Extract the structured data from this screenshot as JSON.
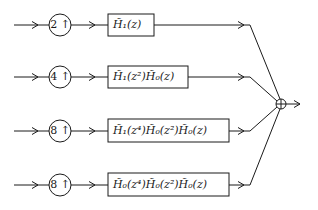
{
  "diagram": {
    "type": "synthesis filter bank (tree-equivalent)",
    "branches": [
      {
        "upsampler": "2 ↑",
        "filter": "H̃₁(z)"
      },
      {
        "upsampler": "4 ↑",
        "filter": "H̃₁(z²)H̃₀(z)"
      },
      {
        "upsampler": "8 ↑",
        "filter": "H̃₁(z⁴)H̃₀(z²)H̃₀(z)"
      },
      {
        "upsampler": "8 ↑",
        "filter": "H̃₀(z⁴)H̃₀(z²)H̃₀(z)"
      }
    ],
    "summer": "⊕",
    "colors": {
      "stroke": "#1a1a1a",
      "background": "#ffffff"
    }
  }
}
